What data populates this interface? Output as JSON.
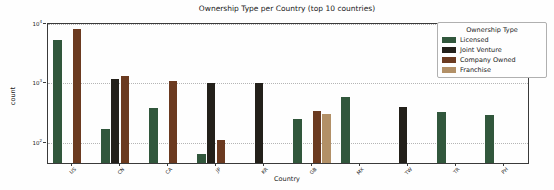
{
  "window": {
    "background": "#fefefe"
  },
  "chart_data": {
    "type": "bar",
    "title": "Ownership Type per Country (top 10 countries)",
    "xlabel": "Country",
    "ylabel": "count",
    "yscale": "log",
    "ylim": [
      46,
      10000
    ],
    "yticks": [
      100,
      1000,
      10000
    ],
    "grid": "horizontal-dotted",
    "legend_position": "upper right",
    "legend_title": "Ownership Type",
    "categories": [
      "US",
      "CN",
      "CA",
      "JP",
      "KR",
      "GB",
      "MX",
      "TW",
      "TR",
      "PH"
    ],
    "series": [
      {
        "name": "Licensed",
        "color": "#31573c",
        "values": [
          5400,
          170,
          380,
          66,
          null,
          250,
          590,
          null,
          330,
          300
        ]
      },
      {
        "name": "Joint Venture",
        "color": "#23201a",
        "values": [
          null,
          1200,
          null,
          1030,
          1000,
          null,
          null,
          400,
          null,
          null
        ]
      },
      {
        "name": "Company Owned",
        "color": "#6b3a20",
        "values": [
          8200,
          1350,
          1100,
          110,
          null,
          340,
          null,
          null,
          null,
          null
        ]
      },
      {
        "name": "Franchise",
        "color": "#b29067",
        "values": [
          null,
          null,
          null,
          null,
          null,
          305,
          null,
          null,
          null,
          null
        ]
      }
    ]
  },
  "colors": {
    "gridline": "#b5b5b5",
    "spine": "#3a3a3a",
    "text": "#222222"
  }
}
